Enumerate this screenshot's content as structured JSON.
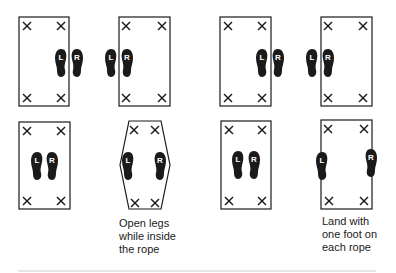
{
  "sequences": [
    {
      "id": "jump-across-rope",
      "panels": [
        {
          "shape": "rectangle",
          "feet": "outside-right",
          "labels": [
            "L",
            "R"
          ]
        },
        {
          "shape": "rectangle",
          "feet": "outside-left",
          "labels": [
            "L",
            "R"
          ]
        }
      ]
    },
    {
      "id": "jump-across-rope-2",
      "panels": [
        {
          "shape": "rectangle",
          "feet": "outside-right",
          "labels": [
            "L",
            "R"
          ]
        },
        {
          "shape": "rectangle",
          "feet": "outside-left",
          "labels": [
            "L",
            "R"
          ]
        }
      ]
    },
    {
      "id": "open-legs",
      "panels": [
        {
          "shape": "rectangle",
          "feet": "inside-center",
          "labels": [
            "L",
            "R"
          ]
        },
        {
          "shape": "hexagon",
          "feet": "inside-apart",
          "labels": [
            "L",
            "R"
          ]
        }
      ],
      "caption": [
        "Open legs",
        "while inside",
        "the rope"
      ]
    },
    {
      "id": "land-on-rope",
      "panels": [
        {
          "shape": "rectangle",
          "feet": "inside-center",
          "labels": [
            "L",
            "R"
          ]
        },
        {
          "shape": "rectangle",
          "feet": "on-each-rope",
          "labels": [
            "L",
            "R"
          ]
        }
      ],
      "caption": [
        "Land with",
        "one foot on",
        "each rope"
      ]
    }
  ],
  "marker_glyph": "×",
  "foot_labels": {
    "left": "L",
    "right": "R"
  },
  "colors": {
    "ink": "#1a1a1a",
    "background": "#ffffff",
    "rule": "#e6e6e6"
  }
}
